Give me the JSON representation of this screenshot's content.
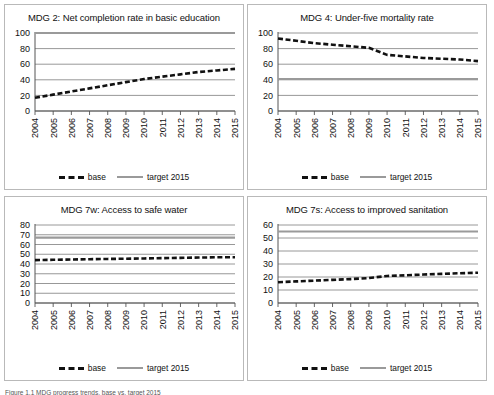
{
  "figure": {
    "caption": "Figure 1.1  MDG progress trends, base vs. target 2015",
    "legend": {
      "base_label": "base",
      "target_label": "target 2015"
    },
    "colors": {
      "base_line": "#111111",
      "target_line": "#9a9a9a",
      "gridline": "#8c8c8c",
      "axis": "#555555",
      "panel_border": "#b9b9b9",
      "background": "#ffffff"
    }
  },
  "chart_data": [
    {
      "type": "line",
      "title": "MDG 2: Net completion rate in basic education",
      "xlabel": "",
      "ylabel": "",
      "ylim": [
        0,
        100
      ],
      "yticks": [
        0,
        20,
        40,
        60,
        80,
        100
      ],
      "grid": true,
      "legend_position": "bottom",
      "x": [
        "2004",
        "2005",
        "2006",
        "2007",
        "2008",
        "2009",
        "2010",
        "2011",
        "2012",
        "2013",
        "2014",
        "2015"
      ],
      "series": [
        {
          "name": "base",
          "style": "dashed",
          "values": [
            17,
            21,
            25,
            29,
            33,
            37,
            41,
            44,
            47,
            50,
            52,
            54
          ]
        },
        {
          "name": "target 2015",
          "style": "solid",
          "values": [
            100,
            100,
            100,
            100,
            100,
            100,
            100,
            100,
            100,
            100,
            100,
            100
          ]
        }
      ]
    },
    {
      "type": "line",
      "title": "MDG 4: Under-five mortality rate",
      "xlabel": "",
      "ylabel": "",
      "ylim": [
        0,
        100
      ],
      "yticks": [
        0,
        20,
        40,
        60,
        80,
        100
      ],
      "grid": true,
      "legend_position": "bottom",
      "x": [
        "2004",
        "2005",
        "2006",
        "2007",
        "2008",
        "2009",
        "2010",
        "2011",
        "2012",
        "2013",
        "2014",
        "2015"
      ],
      "series": [
        {
          "name": "base",
          "style": "dashed",
          "values": [
            93,
            90,
            87,
            85,
            83,
            81,
            72,
            70,
            68,
            67,
            66,
            64
          ]
        },
        {
          "name": "target 2015",
          "style": "solid",
          "values": [
            41,
            41,
            41,
            41,
            41,
            41,
            41,
            41,
            41,
            41,
            41,
            41
          ]
        }
      ]
    },
    {
      "type": "line",
      "title": "MDG 7w: Access to safe water",
      "xlabel": "",
      "ylabel": "",
      "ylim": [
        0,
        80
      ],
      "yticks": [
        0,
        10,
        20,
        30,
        40,
        50,
        60,
        70,
        80
      ],
      "grid": true,
      "legend_position": "bottom",
      "x": [
        "2004",
        "2005",
        "2006",
        "2007",
        "2008",
        "2009",
        "2010",
        "2011",
        "2012",
        "2013",
        "2014",
        "2015"
      ],
      "series": [
        {
          "name": "base",
          "style": "dashed",
          "values": [
            44,
            44.3,
            44.6,
            44.9,
            45.2,
            45.4,
            45.7,
            46,
            46.3,
            46.6,
            46.9,
            47
          ]
        },
        {
          "name": "target 2015",
          "style": "solid",
          "values": [
            67,
            67,
            67,
            67,
            67,
            67,
            67,
            67,
            67,
            67,
            67,
            67
          ]
        }
      ]
    },
    {
      "type": "line",
      "title": "MDG 7s: Access to improved sanitation",
      "xlabel": "",
      "ylabel": "",
      "ylim": [
        0,
        60
      ],
      "yticks": [
        0,
        10,
        20,
        30,
        40,
        50,
        60
      ],
      "grid": true,
      "legend_position": "bottom",
      "x": [
        "2004",
        "2005",
        "2006",
        "2007",
        "2008",
        "2009",
        "2010",
        "2011",
        "2012",
        "2013",
        "2014",
        "2015"
      ],
      "series": [
        {
          "name": "base",
          "style": "dashed",
          "values": [
            16,
            16.6,
            17.2,
            17.8,
            18.4,
            19.2,
            20.8,
            21.3,
            21.9,
            22.4,
            22.9,
            23.3
          ]
        },
        {
          "name": "target 2015",
          "style": "solid",
          "values": [
            55,
            55,
            55,
            55,
            55,
            55,
            55,
            55,
            55,
            55,
            55,
            55
          ]
        }
      ]
    }
  ]
}
